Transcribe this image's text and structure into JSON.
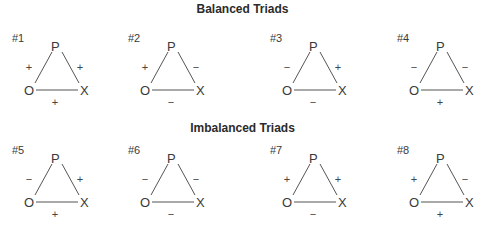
{
  "sections": [
    {
      "title": "Balanced Triads",
      "triads": [
        {
          "label": "#1",
          "nodes": {
            "top": "P",
            "left": "O",
            "right": "X"
          },
          "signs": {
            "po": "+",
            "px": "+",
            "ox": "+"
          }
        },
        {
          "label": "#2",
          "nodes": {
            "top": "P",
            "left": "O",
            "right": "X"
          },
          "signs": {
            "po": "+",
            "px": "−",
            "ox": "−"
          }
        },
        {
          "label": "#3",
          "nodes": {
            "top": "P",
            "left": "O",
            "right": "X"
          },
          "signs": {
            "po": "−",
            "px": "+",
            "ox": "−"
          }
        },
        {
          "label": "#4",
          "nodes": {
            "top": "P",
            "left": "O",
            "right": "X"
          },
          "signs": {
            "po": "−",
            "px": "−",
            "ox": "+"
          }
        }
      ]
    },
    {
      "title": "Imbalanced Triads",
      "triads": [
        {
          "label": "#5",
          "nodes": {
            "top": "P",
            "left": "O",
            "right": "X"
          },
          "signs": {
            "po": "−",
            "px": "+",
            "ox": "+"
          }
        },
        {
          "label": "#6",
          "nodes": {
            "top": "P",
            "left": "O",
            "right": "X"
          },
          "signs": {
            "po": "−",
            "px": "−",
            "ox": "−"
          }
        },
        {
          "label": "#7",
          "nodes": {
            "top": "P",
            "left": "O",
            "right": "X"
          },
          "signs": {
            "po": "+",
            "px": "+",
            "ox": "−"
          }
        },
        {
          "label": "#8",
          "nodes": {
            "top": "P",
            "left": "O",
            "right": "X"
          },
          "signs": {
            "po": "+",
            "px": "−",
            "ox": "+"
          }
        }
      ]
    }
  ]
}
